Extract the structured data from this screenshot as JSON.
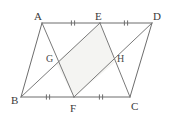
{
  "figure": {
    "width": 171,
    "height": 120,
    "background_color": "#ffffff",
    "line_color": "#6d6d6d",
    "shade_color": "#f4f4f2",
    "label_color": "#3a3a3a"
  },
  "points": {
    "A": {
      "label": "A",
      "x": 42,
      "y": 23,
      "label_x": 34,
      "label_y": 20
    },
    "E": {
      "label": "E",
      "x": 100,
      "y": 23,
      "label_x": 95,
      "label_y": 20
    },
    "D": {
      "label": "D",
      "x": 152,
      "y": 23,
      "label_x": 153,
      "label_y": 20
    },
    "B": {
      "label": "B",
      "x": 21,
      "y": 97,
      "label_x": 11,
      "label_y": 104
    },
    "F": {
      "label": "F",
      "x": 74,
      "y": 97,
      "label_x": 70,
      "label_y": 112
    },
    "C": {
      "label": "C",
      "x": 130,
      "y": 97,
      "label_x": 131,
      "label_y": 110
    },
    "G": {
      "label": "G",
      "x": 56,
      "y": 63,
      "label_x": 46,
      "label_y": 62
    },
    "H": {
      "label": "H",
      "x": 115,
      "y": 62,
      "label_x": 117,
      "label_y": 62
    }
  },
  "segments": [
    {
      "name": "AE",
      "from": "A",
      "to": "E",
      "kind": "edge"
    },
    {
      "name": "ED",
      "from": "E",
      "to": "D",
      "kind": "edge"
    },
    {
      "name": "BF",
      "from": "B",
      "to": "F",
      "kind": "edge"
    },
    {
      "name": "FC",
      "from": "F",
      "to": "C",
      "kind": "edge"
    },
    {
      "name": "AB",
      "from": "A",
      "to": "B",
      "kind": "edge"
    },
    {
      "name": "DC",
      "from": "D",
      "to": "C",
      "kind": "edge"
    },
    {
      "name": "AF",
      "from": "A",
      "to": "F",
      "kind": "cevian"
    },
    {
      "name": "BE",
      "from": "B",
      "to": "E",
      "kind": "cevian"
    },
    {
      "name": "EC",
      "from": "E",
      "to": "C",
      "kind": "cevian"
    },
    {
      "name": "DF",
      "from": "D",
      "to": "F",
      "kind": "cevian"
    }
  ],
  "shaded_polygon": {
    "name": "GEHF",
    "vertices": [
      "G",
      "E",
      "H",
      "F"
    ]
  },
  "tick_marks": [
    {
      "name": "tick-AE",
      "on": "AE",
      "x": 73,
      "y": 23,
      "count": 2,
      "orientation": "vertical"
    },
    {
      "name": "tick-ED",
      "on": "ED",
      "x": 126,
      "y": 23,
      "count": 2,
      "orientation": "vertical"
    },
    {
      "name": "tick-BF",
      "on": "BF",
      "x": 48,
      "y": 97,
      "count": 2,
      "orientation": "vertical"
    },
    {
      "name": "tick-FC",
      "on": "FC",
      "x": 101,
      "y": 97,
      "count": 2,
      "orientation": "vertical"
    }
  ]
}
